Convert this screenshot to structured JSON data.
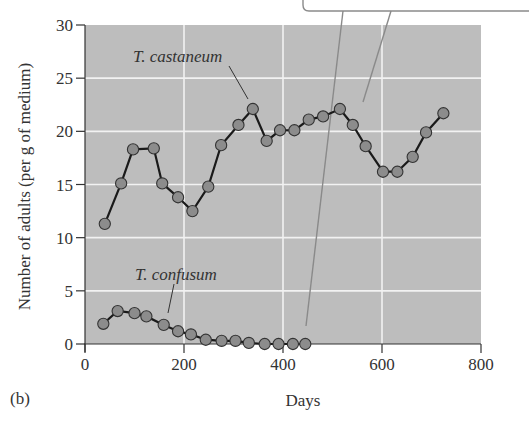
{
  "chart_data": {
    "type": "line",
    "title": "",
    "panel_label": "(b)",
    "xlabel": "Days",
    "ylabel": "Number of adults (per g of medium)",
    "xlim": [
      0,
      800
    ],
    "ylim": [
      0,
      30
    ],
    "xticks": [
      0,
      200,
      400,
      600,
      800
    ],
    "yticks": [
      0,
      5,
      10,
      15,
      20,
      25,
      30
    ],
    "grid": true,
    "legend": "inline labels",
    "series": [
      {
        "name": "T. castaneum",
        "label_pos": {
          "x": 310,
          "y": 27
        },
        "x": [
          40,
          73,
          97,
          139,
          156,
          188,
          217,
          249,
          275,
          310,
          339,
          367,
          394,
          423,
          452,
          481,
          515,
          541,
          567,
          602,
          631,
          662,
          689,
          724
        ],
        "values": [
          11.3,
          15.1,
          18.3,
          18.4,
          15.1,
          13.8,
          12.5,
          14.8,
          18.7,
          20.6,
          22.1,
          19.1,
          20.1,
          20.1,
          21.1,
          21.4,
          22.1,
          20.6,
          18.6,
          16.2,
          16.2,
          17.6,
          19.9,
          21.7
        ]
      },
      {
        "name": "T. confusum",
        "label_pos": {
          "x": 310,
          "y": 6.6
        },
        "x": [
          37,
          66,
          100,
          124,
          159,
          188,
          214,
          244,
          276,
          304,
          331,
          363,
          391,
          420,
          445
        ],
        "values": [
          1.9,
          3.1,
          2.9,
          2.6,
          1.8,
          1.2,
          0.9,
          0.4,
          0.3,
          0.3,
          0.1,
          0,
          0,
          0,
          0
        ]
      }
    ]
  },
  "colors": {
    "plot_bg": "#bdbdbd",
    "grid": "#f2f2f2",
    "marker_fill": "#8c8c8c",
    "marker_stroke": "#333333",
    "line": "#1a1a1a",
    "callout": "#8a8a8a"
  }
}
